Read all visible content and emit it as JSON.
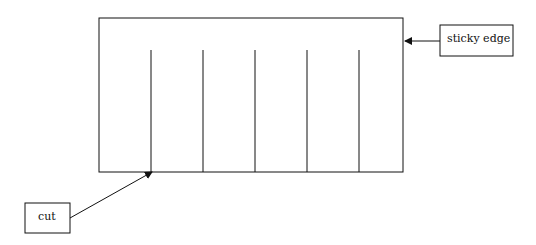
{
  "diagram": {
    "labels": {
      "sticky_edge": "sticky edge",
      "cut": "cut"
    },
    "main_rect": {
      "x": 99,
      "y": 18,
      "width": 304,
      "height": 154
    },
    "cut_lines_x": [
      151,
      203,
      255,
      307,
      359
    ],
    "cut_line_top_y": 50,
    "colors": {
      "stroke": "#111111",
      "background": "#ffffff"
    }
  }
}
